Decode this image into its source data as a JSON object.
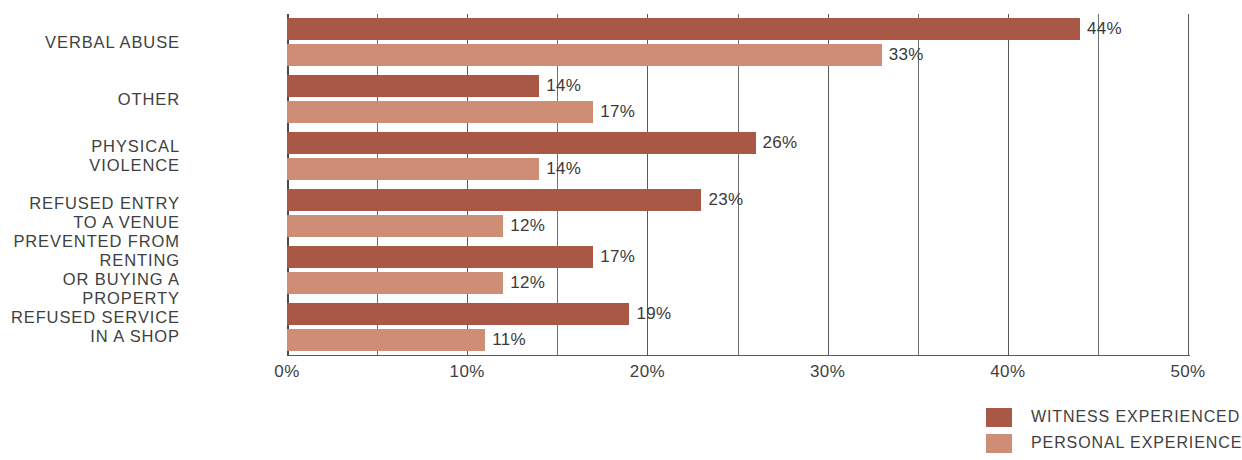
{
  "chart_data": {
    "type": "bar",
    "orientation": "horizontal",
    "title": "",
    "subtitle": "",
    "xlabel": "",
    "ylabel": "",
    "xlim": [
      0,
      50
    ],
    "x_tick_labels": [
      "0%",
      "10%",
      "20%",
      "30%",
      "40%",
      "50%"
    ],
    "x_ticks": [
      0,
      10,
      20,
      30,
      40,
      50
    ],
    "x_minor_ticks": [
      5,
      15,
      25,
      35,
      45
    ],
    "grid": true,
    "grid_axis": "x",
    "value_suffix": "%",
    "legend_position": "bottom-right",
    "categories": [
      "VERBAL ABUSE",
      "OTHER",
      "PHYSICAL VIOLENCE",
      "REFUSED ENTRY TO A VENUE",
      "PREVENTED FROM RENTING\nOR BUYING A PROPERTY",
      "REFUSED SERVICE IN A SHOP"
    ],
    "series": [
      {
        "name": "WITNESS EXPERIENCED",
        "color": "#a85844",
        "values": [
          44,
          14,
          26,
          23,
          17,
          19
        ],
        "labels": [
          "44%",
          "14%",
          "26%",
          "23%",
          "17%",
          "19%"
        ]
      },
      {
        "name": "PERSONAL EXPERIENCE",
        "color": "#ce8e76",
        "values": [
          33,
          17,
          14,
          12,
          12,
          11
        ],
        "labels": [
          "33%",
          "17%",
          "14%",
          "12%",
          "12%",
          "11%"
        ]
      }
    ]
  },
  "legend": {
    "items": [
      {
        "label": "WITNESS EXPERIENCED",
        "color": "#a85844"
      },
      {
        "label": "PERSONAL EXPERIENCE",
        "color": "#ce8e76"
      }
    ]
  }
}
